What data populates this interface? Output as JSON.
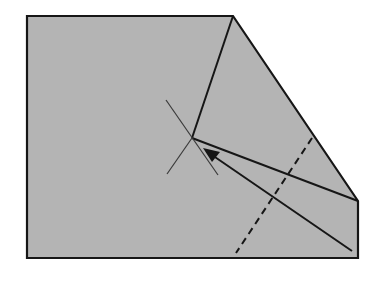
{
  "diagram": {
    "type": "origami-fold-step",
    "colors": {
      "background": "#ffffff",
      "paper": "#b4b4b4",
      "line": "#161616",
      "reference": "#3a3a3a"
    },
    "paper_outline": [
      [
        27,
        16
      ],
      [
        233,
        16
      ],
      [
        358,
        201
      ],
      [
        358,
        258
      ],
      [
        27,
        258
      ]
    ],
    "crease_lines": [
      {
        "name": "crease-from-top-corner",
        "from": [
          233,
          16
        ],
        "to": [
          192,
          138
        ]
      },
      {
        "name": "crease-to-right-corner",
        "from": [
          192,
          138
        ],
        "to": [
          358,
          201
        ]
      }
    ],
    "reference_cross": [
      {
        "from": [
          166,
          100
        ],
        "to": [
          218,
          175
        ]
      },
      {
        "from": [
          192,
          138
        ],
        "to": [
          167,
          174
        ]
      }
    ],
    "valley_fold_dashed": {
      "from": [
        312,
        138
      ],
      "to": [
        236,
        253
      ]
    },
    "arrow": {
      "from": [
        352,
        251
      ],
      "to": [
        205,
        150
      ]
    }
  }
}
